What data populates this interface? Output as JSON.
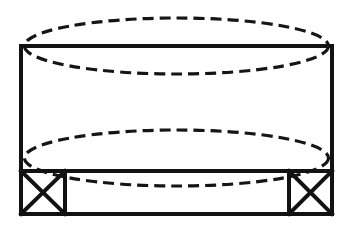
{
  "figure": {
    "kind": "technical-line-drawing",
    "canvas": {
      "width": 351,
      "height": 229,
      "background": "#ffffff"
    },
    "stroke_colors": {
      "solid": "#121212",
      "hidden": "#151515"
    },
    "line_weights": {
      "outer_rectangle": 4,
      "divider": 4,
      "bracket_box": 4,
      "bracket_diagonal": 4,
      "hidden_dash": 3.2
    },
    "dash_pattern": "11 6",
    "outer_rectangle": {
      "name": "main-body-outline",
      "x": 21,
      "y": 46,
      "width": 311,
      "height": 168,
      "right": 332,
      "bottom": 214
    },
    "divider_line": {
      "name": "base-divider",
      "y": 171,
      "x_start": 21,
      "x_end": 332
    },
    "bracket_left": {
      "name": "left-support-bracket",
      "x": 21,
      "y": 171,
      "width": 44,
      "height": 43,
      "marking": "diagonal-cross"
    },
    "bracket_right": {
      "name": "right-support-bracket",
      "x": 289,
      "y": 171,
      "width": 43,
      "height": 43,
      "marking": "diagonal-cross"
    },
    "hidden_ellipses": [
      {
        "name": "upper-hidden-ellipse",
        "cx": 176.5,
        "cy": 46,
        "rx": 152,
        "ry": 28,
        "top_apex_y": 18,
        "bottom_apex_y": 74
      },
      {
        "name": "lower-hidden-ellipse",
        "cx": 176.5,
        "cy": 158,
        "rx": 152,
        "ry": 28,
        "top_apex_y": 130,
        "bottom_apex_y": 186
      }
    ]
  }
}
